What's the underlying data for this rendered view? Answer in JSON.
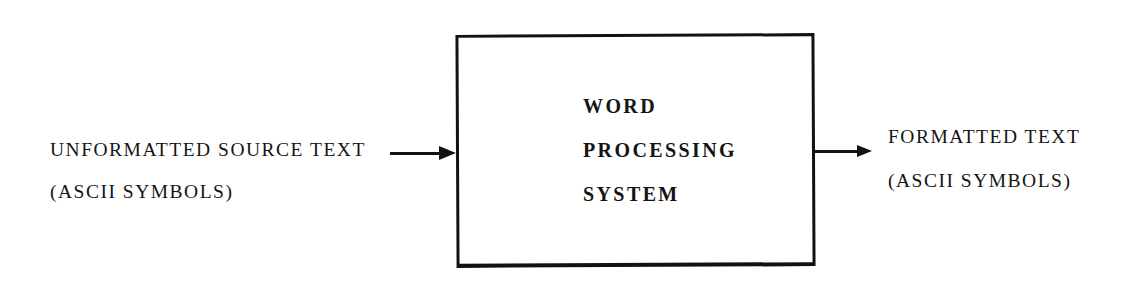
{
  "diagram": {
    "type": "block-diagram",
    "background_color": "#ffffff",
    "ink_color": "#121212",
    "process": {
      "label_lines": [
        "WORD",
        "PROCESSING",
        "SYSTEM"
      ]
    },
    "flows": {
      "input": {
        "label_lines": [
          "UNFORMATTED SOURCE TEXT",
          "(ASCII SYMBOLS)"
        ],
        "direction": "right"
      },
      "output": {
        "label_lines": [
          "FORMATTED TEXT",
          "(ASCII SYMBOLS)"
        ],
        "direction": "right"
      }
    }
  }
}
